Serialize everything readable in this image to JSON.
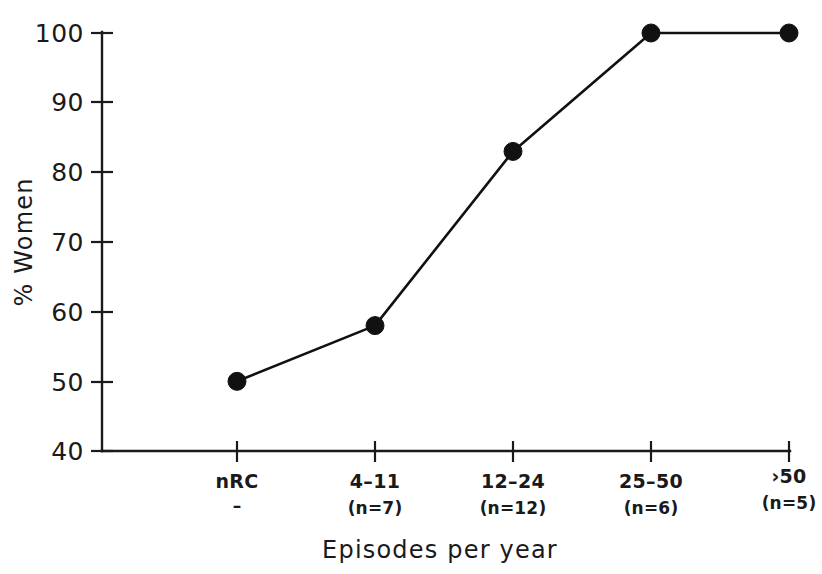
{
  "chart_data": {
    "type": "line",
    "title": "",
    "xlabel": "Episodes per year",
    "ylabel": "% Women",
    "categories": [
      "nRC",
      "4–11",
      "12–24",
      "25–50",
      "›50"
    ],
    "category_sublabels": [
      "–",
      "(n=7)",
      "(n=12)",
      "(n=6)",
      "(n=5)"
    ],
    "values": [
      50,
      58,
      83,
      100,
      100
    ],
    "ylim": [
      40,
      100
    ],
    "ytick_labels": [
      "40",
      "50",
      "60",
      "70",
      "80",
      "90",
      "100"
    ],
    "ytick_values": [
      40,
      50,
      60,
      70,
      80,
      90,
      100
    ],
    "grid": false,
    "legend": false,
    "marker": "filled-circle",
    "line_color": "#111111",
    "marker_color": "#111111",
    "axis_color": "#1a1a1a",
    "background_color": "#ffffff"
  }
}
